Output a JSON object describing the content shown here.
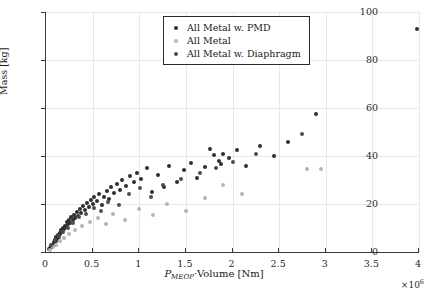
{
  "chart_data": {
    "type": "scatter",
    "title": "",
    "xlabel": "P_MEOP·Volume [Nm]",
    "xlabel_main": "·Volume [Nm]",
    "xlabel_symbol": "P",
    "xlabel_subscript": "MEOP",
    "ylabel": "Mass [kg]",
    "x_exponent": "×10",
    "x_exponent_power": "6",
    "xlim": [
      0,
      4000000
    ],
    "ylim": [
      0,
      100
    ],
    "xticks": [
      0,
      500000,
      1000000,
      1500000,
      2000000,
      2500000,
      3000000,
      3500000,
      4000000
    ],
    "xticklabels": [
      "0",
      "0.5",
      "1",
      "1.5",
      "2",
      "2.5",
      "3",
      "3.5",
      "4"
    ],
    "yticks": [
      0,
      20,
      40,
      60,
      80,
      100
    ],
    "yticklabels": [
      "0",
      "20",
      "40",
      "60",
      "80",
      "100"
    ],
    "grid": true,
    "grid_color": "#e8e8e8",
    "legend_position": "top-center",
    "series": [
      {
        "name": "All Metal w. PMD",
        "color": "#2f2f2f",
        "points": [
          [
            30000,
            1.2
          ],
          [
            45000,
            1.8
          ],
          [
            52000,
            2.4
          ],
          [
            60000,
            2.0
          ],
          [
            68000,
            3.1
          ],
          [
            75000,
            2.6
          ],
          [
            82000,
            4.2
          ],
          [
            90000,
            3.4
          ],
          [
            98000,
            5.0
          ],
          [
            105000,
            4.4
          ],
          [
            112000,
            6.2
          ],
          [
            120000,
            5.5
          ],
          [
            128000,
            7.0
          ],
          [
            136000,
            6.4
          ],
          [
            145000,
            8.1
          ],
          [
            152000,
            7.4
          ],
          [
            160000,
            9.0
          ],
          [
            170000,
            8.3
          ],
          [
            180000,
            10.2
          ],
          [
            190000,
            9.4
          ],
          [
            200000,
            11.0
          ],
          [
            210000,
            10.4
          ],
          [
            220000,
            12.5
          ],
          [
            232000,
            11.6
          ],
          [
            245000,
            13.4
          ],
          [
            258000,
            12.0
          ],
          [
            270000,
            14.6
          ],
          [
            285000,
            13.2
          ],
          [
            300000,
            15.5
          ],
          [
            315000,
            14.0
          ],
          [
            330000,
            16.8
          ],
          [
            345000,
            15.2
          ],
          [
            360000,
            18.0
          ],
          [
            380000,
            16.4
          ],
          [
            400000,
            19.2
          ],
          [
            420000,
            17.5
          ],
          [
            440000,
            20.5
          ],
          [
            460000,
            18.8
          ],
          [
            480000,
            21.6
          ],
          [
            500000,
            20.0
          ],
          [
            520000,
            22.8
          ],
          [
            545000,
            21.2
          ],
          [
            570000,
            24.0
          ],
          [
            600000,
            19.5
          ],
          [
            620000,
            23.0
          ],
          [
            650000,
            25.5
          ],
          [
            680000,
            22.0
          ],
          [
            700000,
            27.0
          ],
          [
            730000,
            24.5
          ],
          [
            760000,
            28.5
          ],
          [
            790000,
            26.0
          ],
          [
            820000,
            30.0
          ],
          [
            860000,
            27.5
          ],
          [
            900000,
            31.5
          ],
          [
            940000,
            29.0
          ],
          [
            980000,
            33.0
          ],
          [
            1020000,
            30.5
          ],
          [
            1080000,
            35.0
          ],
          [
            1140000,
            25.0
          ],
          [
            1200000,
            32.0
          ],
          [
            1260000,
            27.0
          ],
          [
            1320000,
            36.0
          ],
          [
            1400000,
            29.0
          ],
          [
            1480000,
            34.0
          ],
          [
            1550000,
            37.0
          ],
          [
            1620000,
            31.0
          ],
          [
            1700000,
            35.5
          ],
          [
            1760000,
            43.0
          ],
          [
            1800000,
            40.5
          ],
          [
            1850000,
            38.0
          ],
          [
            1880000,
            36.5
          ],
          [
            1900000,
            41.0
          ],
          [
            1960000,
            39.0
          ],
          [
            2050000,
            42.5
          ],
          [
            2150000,
            36.0
          ],
          [
            2300000,
            44.0
          ],
          [
            2450000,
            40.0
          ],
          [
            2600000,
            46.0
          ],
          [
            2900000,
            57.5
          ],
          [
            3980000,
            93.0
          ]
        ]
      },
      {
        "name": "All Metal",
        "color": "#b4b4b4",
        "points": [
          [
            40000,
            1.0
          ],
          [
            70000,
            2.2
          ],
          [
            110000,
            3.0
          ],
          [
            150000,
            4.5
          ],
          [
            195000,
            6.0
          ],
          [
            250000,
            7.5
          ],
          [
            310000,
            9.0
          ],
          [
            390000,
            11.0
          ],
          [
            470000,
            12.5
          ],
          [
            560000,
            14.0
          ],
          [
            640000,
            11.5
          ],
          [
            720000,
            16.0
          ],
          [
            850000,
            13.5
          ],
          [
            1000000,
            18.0
          ],
          [
            1150000,
            15.5
          ],
          [
            1300000,
            20.0
          ],
          [
            1500000,
            17.0
          ],
          [
            1700000,
            22.5
          ],
          [
            1900000,
            28.0
          ],
          [
            2100000,
            24.0
          ],
          [
            2800000,
            34.5
          ],
          [
            2950000,
            34.5
          ]
        ]
      },
      {
        "name": "All Metal w. Diaphragm",
        "color": "#4d4d4d",
        "points": [
          [
            55000,
            2.8
          ],
          [
            95000,
            4.8
          ],
          [
            140000,
            6.6
          ],
          [
            185000,
            8.5
          ],
          [
            235000,
            10.0
          ],
          [
            290000,
            12.0
          ],
          [
            350000,
            14.5
          ],
          [
            430000,
            16.0
          ],
          [
            510000,
            18.5
          ],
          [
            590000,
            17.0
          ],
          [
            670000,
            21.0
          ],
          [
            780000,
            19.5
          ],
          [
            890000,
            24.0
          ],
          [
            1010000,
            26.5
          ],
          [
            1130000,
            23.0
          ],
          [
            1250000,
            28.0
          ],
          [
            1450000,
            30.5
          ],
          [
            1650000,
            33.0
          ],
          [
            1820000,
            35.0
          ],
          [
            2000000,
            37.5
          ],
          [
            2250000,
            41.0
          ],
          [
            2750000,
            49.0
          ]
        ]
      }
    ]
  },
  "legend": {
    "items": [
      {
        "label": "All Metal w. PMD",
        "color": "#2f2f2f"
      },
      {
        "label": "All Metal",
        "color": "#b4b4b4"
      },
      {
        "label": "All Metal w. Diaphragm",
        "color": "#4d4d4d"
      }
    ]
  }
}
